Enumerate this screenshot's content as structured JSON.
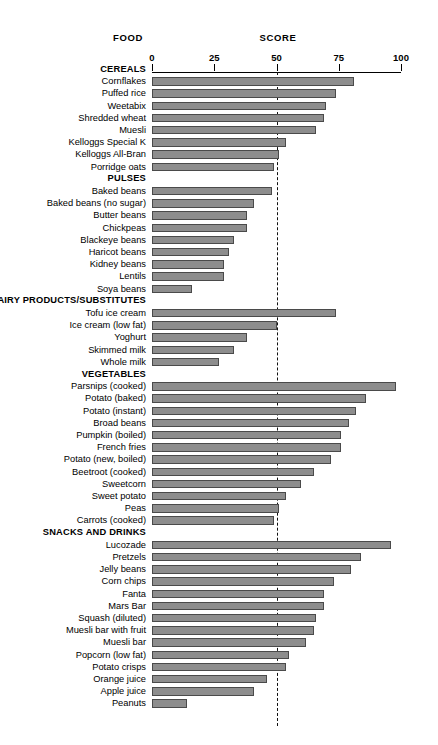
{
  "header": {
    "food_label": "FOOD",
    "score_label": "SCORE"
  },
  "chart_data": {
    "type": "bar",
    "orientation": "horizontal",
    "title": "",
    "xlabel": "SCORE",
    "ylabel": "FOOD",
    "xlim": [
      0,
      100
    ],
    "xticks": [
      0,
      25,
      50,
      75,
      100
    ],
    "xtick_labels": [
      "0",
      "25",
      "50",
      "75",
      "100"
    ],
    "grid": false,
    "reference_line": {
      "value": 50,
      "style": "dashed"
    },
    "bar_color": "#8d8d8d",
    "bar_border_color": "#4a4a4a",
    "groups": [
      {
        "name": "CEREALS",
        "items": [
          {
            "label": "Cornflakes",
            "value": 81
          },
          {
            "label": "Puffed rice",
            "value": 74
          },
          {
            "label": "Weetabix",
            "value": 70
          },
          {
            "label": "Shredded wheat",
            "value": 69
          },
          {
            "label": "Muesli",
            "value": 66
          },
          {
            "label": "Kelloggs Special K",
            "value": 54
          },
          {
            "label": "Kelloggs All-Bran",
            "value": 51
          },
          {
            "label": "Porridge oats",
            "value": 49
          }
        ]
      },
      {
        "name": "PULSES",
        "items": [
          {
            "label": "Baked beans",
            "value": 48
          },
          {
            "label": "Baked beans (no sugar)",
            "value": 41
          },
          {
            "label": "Butter beans",
            "value": 38
          },
          {
            "label": "Chickpeas",
            "value": 38
          },
          {
            "label": "Blackeye beans",
            "value": 33
          },
          {
            "label": "Haricot beans",
            "value": 31
          },
          {
            "label": "Kidney beans",
            "value": 29
          },
          {
            "label": "Lentils",
            "value": 29
          },
          {
            "label": "Soya beans",
            "value": 16
          }
        ]
      },
      {
        "name": "DAIRY PRODUCTS/SUBSTITUTES",
        "items": [
          {
            "label": "Tofu ice cream",
            "value": 74
          },
          {
            "label": "Ice cream (low fat)",
            "value": 50
          },
          {
            "label": "Yoghurt",
            "value": 38
          },
          {
            "label": "Skimmed milk",
            "value": 33
          },
          {
            "label": "Whole milk",
            "value": 27
          }
        ]
      },
      {
        "name": "VEGETABLES",
        "items": [
          {
            "label": "Parsnips (cooked)",
            "value": 98
          },
          {
            "label": "Potato (baked)",
            "value": 86
          },
          {
            "label": "Potato (instant)",
            "value": 82
          },
          {
            "label": "Broad beans",
            "value": 79
          },
          {
            "label": "Pumpkin (boiled)",
            "value": 76
          },
          {
            "label": "French fries",
            "value": 76
          },
          {
            "label": "Potato (new, boiled)",
            "value": 72
          },
          {
            "label": "Beetroot (cooked)",
            "value": 65
          },
          {
            "label": "Sweetcorn",
            "value": 60
          },
          {
            "label": "Sweet potato",
            "value": 54
          },
          {
            "label": "Peas",
            "value": 51
          },
          {
            "label": "Carrots (cooked)",
            "value": 49
          }
        ]
      },
      {
        "name": "SNACKS AND DRINKS",
        "items": [
          {
            "label": "Lucozade",
            "value": 96
          },
          {
            "label": "Pretzels",
            "value": 84
          },
          {
            "label": "Jelly beans",
            "value": 80
          },
          {
            "label": "Corn chips",
            "value": 73
          },
          {
            "label": "Fanta",
            "value": 69
          },
          {
            "label": "Mars Bar",
            "value": 69
          },
          {
            "label": "Squash (diluted)",
            "value": 66
          },
          {
            "label": "Muesli bar with fruit",
            "value": 65
          },
          {
            "label": "Muesli bar",
            "value": 62
          },
          {
            "label": "Popcorn (low fat)",
            "value": 55
          },
          {
            "label": "Potato crisps",
            "value": 54
          },
          {
            "label": "Orange juice",
            "value": 46
          },
          {
            "label": "Apple juice",
            "value": 41
          },
          {
            "label": "Peanuts",
            "value": 14
          }
        ]
      }
    ]
  }
}
